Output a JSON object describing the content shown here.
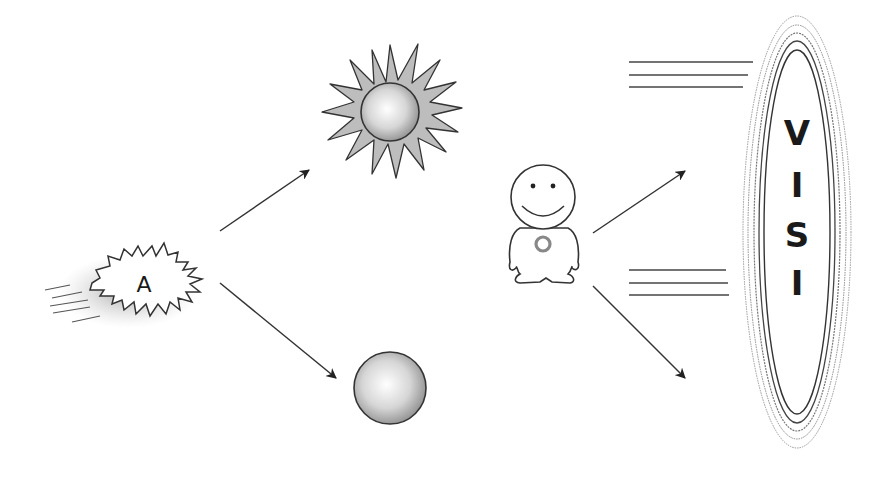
{
  "diagram": {
    "burst": {
      "label": "A"
    },
    "vision": {
      "letters": [
        "V",
        "I",
        "S",
        "I",
        "O",
        "N"
      ],
      "caption_line1": "JD",
      "caption_line2": "$$$"
    },
    "colors": {
      "stroke": "#333333",
      "sun_fill": "#bdbdbd",
      "background": "#ffffff"
    }
  }
}
